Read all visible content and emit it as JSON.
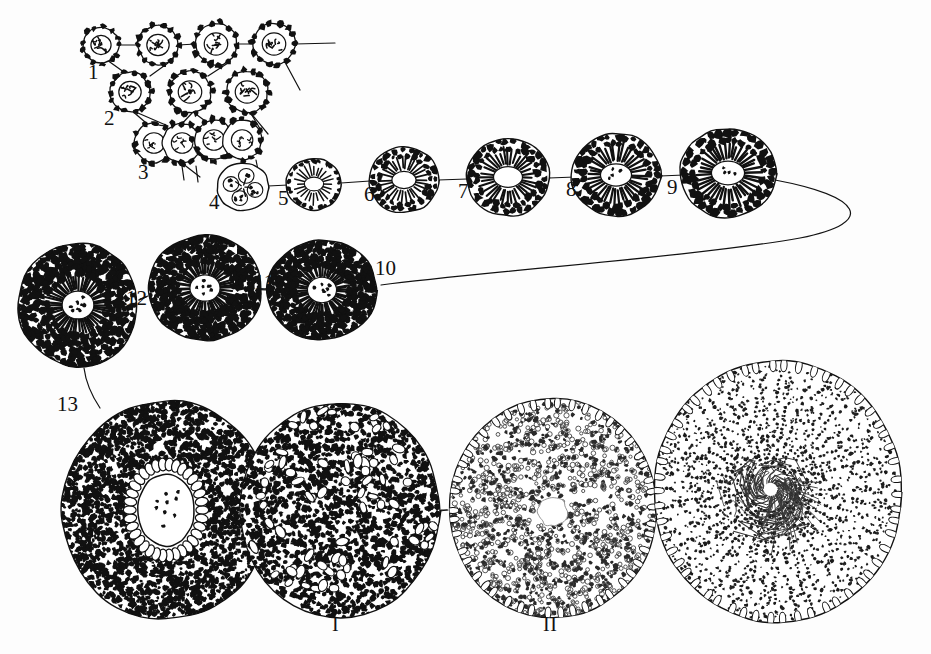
{
  "figure": {
    "background_color": "#fdfdfd",
    "ink_color": "#111111"
  },
  "labels": {
    "n1": "1",
    "n2": "2",
    "n3": "3",
    "n4": "4",
    "n5": "5",
    "n6": "6",
    "n7": "7",
    "n8": "8",
    "n9": "9",
    "n10": "10",
    "n11": "11",
    "n12": "12",
    "n13": "13",
    "r1": "I",
    "r2": "II"
  },
  "stages": {
    "row1": [
      {
        "id": "1",
        "label": "1",
        "cx": 101,
        "cy": 45,
        "rx": 18,
        "ry": 18,
        "kind": "small-cell"
      },
      {
        "id": "1b",
        "label": "",
        "cx": 158,
        "cy": 45,
        "rx": 20,
        "ry": 20,
        "kind": "small-cell"
      },
      {
        "id": "1c",
        "label": "",
        "cx": 216,
        "cy": 44,
        "rx": 21,
        "ry": 21,
        "kind": "small-cell"
      },
      {
        "id": "1d",
        "label": "",
        "cx": 274,
        "cy": 44,
        "rx": 21,
        "ry": 21,
        "kind": "small-cell"
      },
      {
        "id": "2",
        "label": "2",
        "cx": 130,
        "cy": 92,
        "rx": 20,
        "ry": 20,
        "kind": "small-cell"
      },
      {
        "id": "2b",
        "label": "",
        "cx": 190,
        "cy": 92,
        "rx": 21,
        "ry": 21,
        "kind": "small-cell"
      },
      {
        "id": "2c",
        "label": "",
        "cx": 247,
        "cy": 92,
        "rx": 21,
        "ry": 21,
        "kind": "small-cell"
      },
      {
        "id": "3",
        "label": "3",
        "cx": 168,
        "cy": 143,
        "rx": 30,
        "ry": 20,
        "kind": "doublet"
      },
      {
        "id": "3b",
        "label": "",
        "cx": 228,
        "cy": 140,
        "rx": 30,
        "ry": 20,
        "kind": "doublet"
      },
      {
        "id": "4",
        "label": "4",
        "cx": 243,
        "cy": 187,
        "rx": 26,
        "ry": 24,
        "kind": "rosette"
      },
      {
        "id": "5",
        "label": "5",
        "cx": 314,
        "cy": 184,
        "rx": 28,
        "ry": 26,
        "kind": "ring"
      },
      {
        "id": "6",
        "label": "6",
        "cx": 404,
        "cy": 180,
        "rx": 35,
        "ry": 33,
        "kind": "ring"
      },
      {
        "id": "7",
        "label": "7",
        "cx": 508,
        "cy": 177,
        "rx": 42,
        "ry": 39,
        "kind": "ring"
      },
      {
        "id": "8",
        "label": "8",
        "cx": 616,
        "cy": 175,
        "rx": 45,
        "ry": 42,
        "kind": "ring"
      },
      {
        "id": "9",
        "label": "9",
        "cx": 728,
        "cy": 173,
        "rx": 48,
        "ry": 45,
        "kind": "ring"
      }
    ],
    "row2": [
      {
        "id": "10",
        "label": "10",
        "cx": 322,
        "cy": 290,
        "rx": 55,
        "ry": 50,
        "kind": "dense"
      },
      {
        "id": "11",
        "label": "11",
        "cx": 205,
        "cy": 288,
        "rx": 57,
        "ry": 53,
        "kind": "dense"
      },
      {
        "id": "12",
        "label": "12",
        "cx": 78,
        "cy": 305,
        "rx": 60,
        "ry": 62,
        "kind": "dense"
      }
    ],
    "row3": [
      {
        "id": "13",
        "label": "13",
        "cx": 166,
        "cy": 510,
        "rx": 105,
        "ry": 110,
        "kind": "follicle-dark"
      },
      {
        "id": "I",
        "label": "I",
        "cx": 340,
        "cy": 510,
        "rx": 100,
        "ry": 108,
        "kind": "follicle-stipple"
      },
      {
        "id": "II",
        "label": "II",
        "cx": 553,
        "cy": 508,
        "rx": 105,
        "ry": 110,
        "kind": "follicle-light"
      },
      {
        "id": "III",
        "label": "",
        "cx": 778,
        "cy": 492,
        "rx": 125,
        "ry": 132,
        "kind": "follicle-radial"
      }
    ]
  }
}
